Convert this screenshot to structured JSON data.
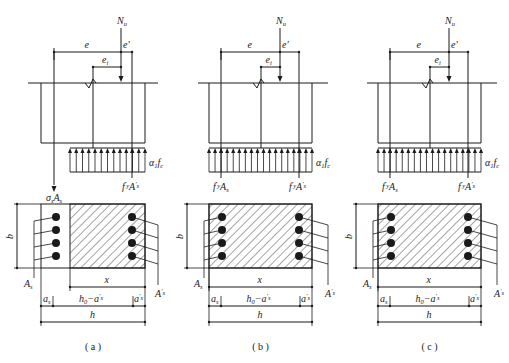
{
  "figure": {
    "panels": [
      {
        "id": "a",
        "caption": "( a )",
        "load": {
          "symbol": "N",
          "sub": "u"
        },
        "eccentricities": {
          "e": "e",
          "e_prime": "e'",
          "e_i": {
            "symbol": "e",
            "sub": "i"
          }
        },
        "left_force": {
          "main": "σ",
          "sub1": "s",
          "mid": "A",
          "sub2": "s"
        },
        "right_force": {
          "main": "f",
          "sup1": "'",
          "sub1": "y",
          "mid": "A",
          "sup2": "'",
          "sub2": "s"
        },
        "stress_block": {
          "main": "α",
          "sub1": "1",
          "mid": "f",
          "sub2": "c"
        },
        "section": {
          "b": "b",
          "As": {
            "main": "A",
            "sub": "s"
          },
          "As_prime": {
            "main": "A",
            "sub": "s",
            "sup": "'"
          },
          "x": "x",
          "a_s": {
            "main": "a",
            "sub": "s"
          },
          "h0_minus": {
            "main": "h",
            "sub": "0",
            "rest": "−a",
            "sub2": "s",
            "sup2": "'"
          },
          "a_s_prime": {
            "main": "a",
            "sub": "s",
            "sup": "'"
          },
          "h": "h"
        },
        "compression_zone": "partial"
      },
      {
        "id": "b",
        "caption": "( b )",
        "load": {
          "symbol": "N",
          "sub": "u"
        },
        "eccentricities": {
          "e": "e",
          "e_prime": "e'",
          "e_i": {
            "symbol": "e",
            "sub": "i"
          }
        },
        "left_force": {
          "main": "f",
          "sup1": "'",
          "sub1": "y",
          "mid": "A",
          "sub2": "s"
        },
        "right_force": {
          "main": "f",
          "sup1": "'",
          "sub1": "y",
          "mid": "A",
          "sup2": "'",
          "sub2": "s"
        },
        "stress_block": {
          "main": "α",
          "sub1": "1",
          "mid": "f",
          "sub2": "c"
        },
        "section": {
          "b": "b",
          "As": {
            "main": "A",
            "sub": "s"
          },
          "As_prime": {
            "main": "A",
            "sub": "s",
            "sup": "'"
          },
          "x": "x",
          "a_s": {
            "main": "a",
            "sub": "s"
          },
          "h0_minus": {
            "main": "h",
            "sub": "0",
            "rest": "−a",
            "sub2": "s",
            "sup2": "'"
          },
          "a_s_prime": {
            "main": "a",
            "sub": "s",
            "sup": "'"
          },
          "h": "h"
        },
        "compression_zone": "full"
      },
      {
        "id": "c",
        "caption": "( c )",
        "load": {
          "symbol": "N",
          "sub": "u"
        },
        "eccentricities": {
          "e": "e",
          "e_prime": "e'",
          "e_i": {
            "symbol": "e",
            "sub": "i"
          }
        },
        "left_force": {
          "main": "f",
          "sup1": "'",
          "sub1": "y",
          "mid": "A",
          "sub2": "s"
        },
        "right_force": {
          "main": "f",
          "sup1": "'",
          "sub1": "y",
          "mid": "A",
          "sup2": "'",
          "sub2": "s"
        },
        "stress_block": {
          "main": "α",
          "sub1": "1",
          "mid": "f",
          "sub2": "c"
        },
        "section": {
          "b": "b",
          "As": {
            "main": "A",
            "sub": "s"
          },
          "As_prime": {
            "main": "A",
            "sub": "s",
            "sup": "'"
          },
          "x": "x",
          "a_s": {
            "main": "a",
            "sub": "s"
          },
          "h0_minus": {
            "main": "h",
            "sub": "0",
            "rest": "−a",
            "sub2": "s",
            "sup2": "'"
          },
          "a_s_prime": {
            "main": "a",
            "sub": "s",
            "sup": "'"
          },
          "h": "h"
        },
        "compression_zone": "full"
      }
    ],
    "colors": {
      "line": "#1a1a1a",
      "background": "#ffffff"
    }
  }
}
